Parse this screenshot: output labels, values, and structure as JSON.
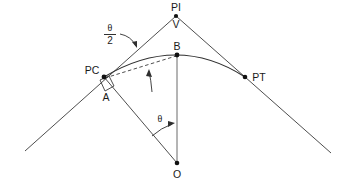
{
  "figure": {
    "kind": "surveying-horizontal-curve-diagram",
    "background_color": "#ffffff",
    "line_color": "#3a3a3a",
    "text_color": "#1a1a1a",
    "width": 345,
    "height": 185
  },
  "points": [
    {
      "id": "PI",
      "label": "PI",
      "x": 176,
      "y": 16,
      "label_x": 176,
      "label_y": 11,
      "dot": true
    },
    {
      "id": "V",
      "label": "V",
      "x": 176,
      "y": 16,
      "label_x": 176,
      "label_y": 28,
      "dot": false
    },
    {
      "id": "B",
      "label": "B",
      "x": 177,
      "y": 55,
      "label_x": 177,
      "label_y": 50,
      "dot": true
    },
    {
      "id": "PC",
      "label": "PC",
      "x": 104,
      "y": 77,
      "label_x": 92,
      "label_y": 74,
      "dot": true
    },
    {
      "id": "PT",
      "label": "PT",
      "x": 245,
      "y": 77,
      "label_x": 259,
      "label_y": 81,
      "dot": true
    },
    {
      "id": "A",
      "label": "A",
      "x": 106,
      "y": 90,
      "label_x": 106,
      "label_y": 101,
      "dot": false
    },
    {
      "id": "O",
      "label": "O",
      "x": 177,
      "y": 163,
      "label_x": 177,
      "label_y": 178,
      "dot": true
    }
  ],
  "angles": {
    "half_delta": {
      "numerator": "θ",
      "denominator": "2",
      "label_x": 110,
      "label_y": 33
    },
    "central": {
      "symbol": "θ",
      "label_x": 160,
      "label_y": 122
    }
  },
  "elements": {
    "back_tangent": "back-tangent-line",
    "forward_tangent": "forward-tangent-line",
    "curve": "circular-curve-arc",
    "chord": "dashed-chord-pc-to-b",
    "radius_pc": "radius-line-pc-to-o",
    "radius_b": "radius-line-b-to-o",
    "right_angle": "right-angle-marker-at-pc",
    "pointer_half_delta": "leader-arrow-to-back-tangent",
    "pointer_curve": "leader-arrow-to-chord",
    "arc_central_angle": "central-angle-arc-at-o"
  }
}
